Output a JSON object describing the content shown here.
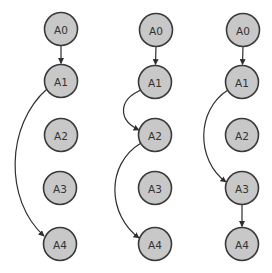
{
  "diagram": {
    "type": "directed-graph-panels",
    "colors": {
      "node_fill": "#c8c8c8",
      "node_stroke": "#3a3a3a",
      "edge": "#2e2e2e",
      "label": "#333333",
      "background": "#ffffff"
    },
    "node_radius": 16.5,
    "panels": [
      {
        "id": "panel-1",
        "nodes": [
          {
            "id": "A0",
            "label": "A0",
            "x": 61,
            "y": 29
          },
          {
            "id": "A1",
            "label": "A1",
            "x": 61,
            "y": 81
          },
          {
            "id": "A2",
            "label": "A2",
            "x": 61,
            "y": 135
          },
          {
            "id": "A3",
            "label": "A3",
            "x": 60,
            "y": 188
          },
          {
            "id": "A4",
            "label": "A4",
            "x": 60,
            "y": 244
          }
        ],
        "edges": [
          {
            "from": "A0",
            "to": "A1",
            "path": "M61 45.5 L61 63.5"
          },
          {
            "from": "A1",
            "to": "A4",
            "path": "M47 89 C 6 125, 4 200, 44 236"
          }
        ]
      },
      {
        "id": "panel-2",
        "nodes": [
          {
            "id": "A0",
            "label": "A0",
            "x": 156,
            "y": 30
          },
          {
            "id": "A1",
            "label": "A1",
            "x": 155,
            "y": 82
          },
          {
            "id": "A2",
            "label": "A2",
            "x": 155,
            "y": 135
          },
          {
            "id": "A3",
            "label": "A3",
            "x": 155,
            "y": 188
          },
          {
            "id": "A4",
            "label": "A4",
            "x": 155,
            "y": 244
          }
        ],
        "edges": [
          {
            "from": "A0",
            "to": "A1",
            "path": "M156 46.5 L155.5 64.5"
          },
          {
            "from": "A1",
            "to": "A2",
            "path": "M141 90 C 118 100, 118 120, 139 130"
          },
          {
            "from": "A2",
            "to": "A4",
            "path": "M141 143 C 105 165, 108 215, 139 238"
          }
        ]
      },
      {
        "id": "panel-3",
        "nodes": [
          {
            "id": "A0",
            "label": "A0",
            "x": 243,
            "y": 30
          },
          {
            "id": "A1",
            "label": "A1",
            "x": 242,
            "y": 82
          },
          {
            "id": "A2",
            "label": "A2",
            "x": 242,
            "y": 135
          },
          {
            "id": "A3",
            "label": "A3",
            "x": 242,
            "y": 188
          },
          {
            "id": "A4",
            "label": "A4",
            "x": 242,
            "y": 244
          }
        ],
        "edges": [
          {
            "from": "A0",
            "to": "A1",
            "path": "M243 46.5 L242.5 64.5"
          },
          {
            "from": "A1",
            "to": "A3",
            "path": "M228 90 C 196 110, 196 160, 226 182"
          },
          {
            "from": "A3",
            "to": "A4",
            "path": "M242 204.5 L242 226.5"
          }
        ]
      }
    ]
  }
}
